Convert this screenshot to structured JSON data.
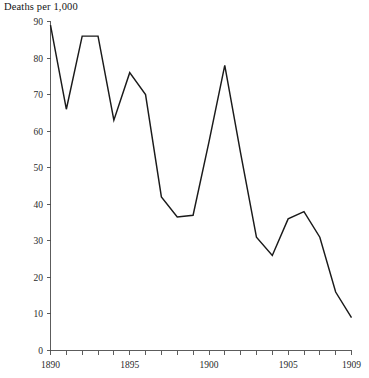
{
  "chart_data": {
    "type": "line",
    "title": "Deaths per 1,000",
    "xlabel": "",
    "ylabel": "Deaths per 1,000",
    "x": [
      1890,
      1891,
      1892,
      1893,
      1894,
      1895,
      1896,
      1897,
      1898,
      1899,
      1900,
      1901,
      1902,
      1903,
      1904,
      1905,
      1906,
      1907,
      1908,
      1909
    ],
    "values": [
      89,
      66,
      86,
      86,
      63,
      76,
      70,
      42,
      36.5,
      37,
      57,
      78,
      54,
      31,
      26,
      36,
      38,
      31,
      16,
      9
    ],
    "series": [
      {
        "name": "Deaths per 1,000",
        "values": [
          89,
          66,
          86,
          86,
          63,
          76,
          70,
          42,
          36.5,
          37,
          57,
          78,
          54,
          31,
          26,
          36,
          38,
          31,
          16,
          9
        ]
      }
    ],
    "xlim": [
      1890,
      1909
    ],
    "ylim": [
      0,
      90
    ],
    "y_ticks": [
      0,
      10,
      20,
      30,
      40,
      50,
      60,
      70,
      80,
      90
    ],
    "y_tick_labels": [
      "0",
      "10",
      "20",
      "30",
      "40",
      "50",
      "60",
      "70",
      "80",
      "90"
    ],
    "x_ticks": [
      1890,
      1891,
      1892,
      1893,
      1894,
      1895,
      1896,
      1897,
      1898,
      1899,
      1900,
      1901,
      1902,
      1903,
      1904,
      1905,
      1906,
      1907,
      1908,
      1909
    ],
    "x_tick_labels_shown": [
      "1890",
      "1895",
      "1900",
      "1905",
      "1909"
    ],
    "x_labeled_ticks": [
      1890,
      1895,
      1900,
      1905,
      1909
    ],
    "grid": false,
    "legend": false,
    "legend_position": "none",
    "line_color": "#1a1a1a",
    "axis_color": "#4a4a4a",
    "background_color": "#ffffff"
  },
  "labels": {
    "title": "Deaths per 1,000",
    "y0": "0",
    "y10": "10",
    "y20": "20",
    "y30": "30",
    "y40": "40",
    "y50": "50",
    "y60": "60",
    "y70": "70",
    "y80": "80",
    "y90": "90",
    "x1890": "1890",
    "x1895": "1895",
    "x1900": "1900",
    "x1905": "1905",
    "x1909": "1909"
  }
}
